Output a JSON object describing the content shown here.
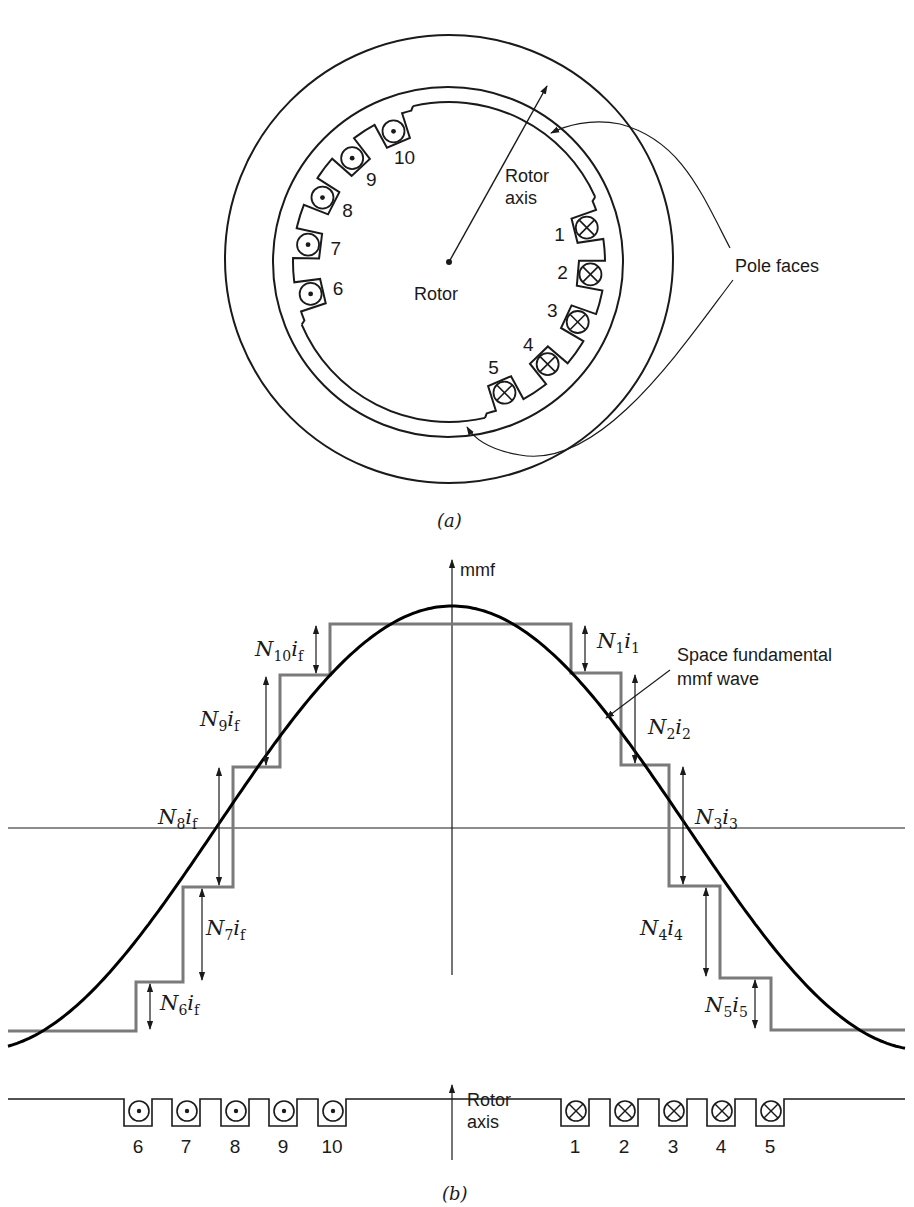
{
  "figure_a": {
    "caption": "(a)",
    "rotor_label": "Rotor",
    "rotor_axis_label_line1": "Rotor",
    "rotor_axis_label_line2": "axis",
    "pole_faces_label": "Pole faces",
    "geometry": {
      "center": [
        449,
        262
      ],
      "outer_radius": 224,
      "outer_center": [
        449,
        259
      ],
      "bore_radius": 175,
      "rotor_radius": 160,
      "axis_tip": [
        547,
        86
      ]
    },
    "slots": [
      {
        "number": "1",
        "angle_deg": 14,
        "current": "into-page"
      },
      {
        "number": "2",
        "angle_deg": -5,
        "current": "into-page"
      },
      {
        "number": "3",
        "angle_deg": -25,
        "current": "into-page"
      },
      {
        "number": "4",
        "angle_deg": -46,
        "current": "into-page"
      },
      {
        "number": "5",
        "angle_deg": -67,
        "current": "into-page"
      },
      {
        "number": "6",
        "angle_deg": 193,
        "current": "out-of-page"
      },
      {
        "number": "7",
        "angle_deg": 173,
        "current": "out-of-page"
      },
      {
        "number": "8",
        "angle_deg": 153,
        "current": "out-of-page"
      },
      {
        "number": "9",
        "angle_deg": 133,
        "current": "out-of-page"
      },
      {
        "number": "10",
        "angle_deg": 113,
        "current": "out-of-page"
      }
    ]
  },
  "figure_b": {
    "caption": "(b)",
    "y_axis_label": "mmf",
    "rotor_axis_label_line1": "Rotor",
    "rotor_axis_label_line2": "axis",
    "fundamental_label_line1": "Space fundamental",
    "fundamental_label_line2": "mmf wave",
    "step_labels": [
      {
        "N": "N",
        "n_sub": "10",
        "i": "i",
        "i_sub": "f"
      },
      {
        "N": "N",
        "n_sub": "9",
        "i": "i",
        "i_sub": "f"
      },
      {
        "N": "N",
        "n_sub": "8",
        "i": "i",
        "i_sub": "f"
      },
      {
        "N": "N",
        "n_sub": "7",
        "i": "i",
        "i_sub": "f"
      },
      {
        "N": "N",
        "n_sub": "6",
        "i": "i",
        "i_sub": "f"
      },
      {
        "N": "N",
        "n_sub": "1",
        "i": "i",
        "i_sub": "1"
      },
      {
        "N": "N",
        "n_sub": "2",
        "i": "i",
        "i_sub": "2"
      },
      {
        "N": "N",
        "n_sub": "3",
        "i": "i",
        "i_sub": "3"
      },
      {
        "N": "N",
        "n_sub": "4",
        "i": "i",
        "i_sub": "4"
      },
      {
        "N": "N",
        "n_sub": "5",
        "i": "i",
        "i_sub": "5"
      }
    ],
    "conductors_left": [
      "6",
      "7",
      "8",
      "9",
      "10"
    ],
    "conductors_right": [
      "1",
      "2",
      "3",
      "4",
      "5"
    ],
    "colors": {
      "staircase": "#7a7a7a",
      "fundamental": "#000000",
      "line": "#1a1a1a"
    }
  }
}
